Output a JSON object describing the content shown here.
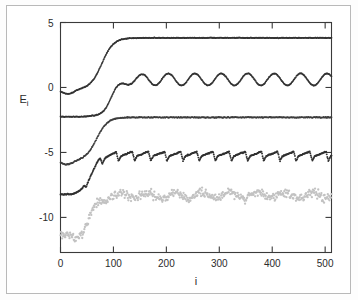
{
  "figure": {
    "background_color": "#ffffff",
    "frame_color": "#b9b9b9",
    "axis_color": "#3a3a3a"
  },
  "axis_titles": {
    "y_main": "E",
    "y_sub": "i",
    "x": "i"
  },
  "chart_data": {
    "type": "scatter",
    "title": "",
    "subtitle": "",
    "xlabel": "i",
    "ylabel": "E_i",
    "xlim": [
      0,
      512
    ],
    "ylim": [
      -12.7,
      5
    ],
    "grid": false,
    "legend": "none",
    "x_ticks": [
      0,
      100,
      200,
      300,
      400,
      500
    ],
    "x_tick_labels": [
      "0",
      "100",
      "200",
      "300",
      "400",
      "500"
    ],
    "y_ticks": [
      5,
      0,
      -5,
      -10
    ],
    "y_tick_labels": [
      "5",
      "0",
      "-5",
      "-10"
    ],
    "series": [
      {
        "name": "level-5-top",
        "color": "#333333",
        "marker": "point",
        "dot_size": 0.85,
        "style": "sigmoid-plateau",
        "start_value": -0.15,
        "plateau_value": 3.82,
        "rise_center": 78,
        "rise_width": 46,
        "noise": 0.035,
        "osc_amplitude": 0.0,
        "osc_period": 0,
        "dip_depth": 0.35,
        "dip_center": 14,
        "n_points": 512
      },
      {
        "name": "level-4-oscillating",
        "color": "#333333",
        "marker": "point",
        "dot_size": 0.85,
        "style": "sigmoid-oscillating",
        "start_value": -2.25,
        "plateau_value": 0.62,
        "rise_center": 96,
        "rise_width": 40,
        "noise": 0.035,
        "osc_amplitude": 0.46,
        "osc_period": 50,
        "osc_phase": 1.1,
        "osc_onset": 115,
        "dip_depth": 0.0,
        "dip_center": 0,
        "n_points": 512
      },
      {
        "name": "level-3-flat",
        "color": "#3d3d3d",
        "marker": "point",
        "dot_size": 0.85,
        "style": "sigmoid-plateau",
        "start_value": -5.62,
        "plateau_value": -2.3,
        "rise_center": 68,
        "rise_width": 44,
        "noise": 0.05,
        "osc_amplitude": 0.0,
        "osc_period": 0,
        "dip_depth": 0.32,
        "dip_center": 12,
        "n_points": 512
      },
      {
        "name": "level-2-sawtooth",
        "color": "#303030",
        "marker": "point",
        "dot_size": 0.95,
        "style": "sawtooth",
        "start_value": -8.25,
        "plateau_value": -5.2,
        "rise_center": 58,
        "rise_width": 40,
        "noise": 0.05,
        "saw_amplitude": 0.62,
        "saw_period": 30.5,
        "saw_phase": 0.25,
        "n_points": 512
      },
      {
        "name": "level-1-scatter",
        "color": "#c2c2c2",
        "marker": "point",
        "dot_size": 1.15,
        "style": "noisy-band",
        "start_value": -11.55,
        "plateau_value": -8.3,
        "rise_center": 58,
        "rise_width": 38,
        "noise": 0.42,
        "osc_amplitude": 0.22,
        "osc_period": 52,
        "osc_phase": 0.6,
        "n_points": 512
      }
    ]
  }
}
